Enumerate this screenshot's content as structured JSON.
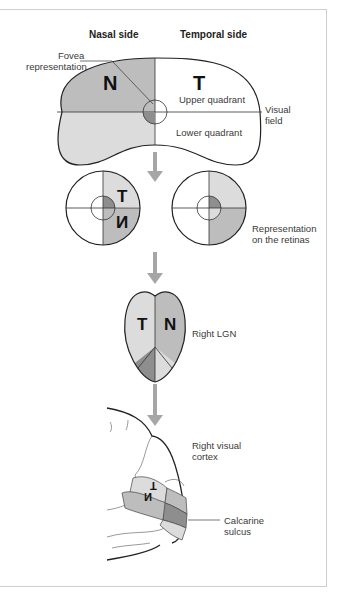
{
  "headers": {
    "nasal": "Nasal side",
    "temporal": "Temporal side"
  },
  "visual_field": {
    "fovea_label_line1": "Fovea",
    "fovea_label_line2": "representation",
    "letter_n": "N",
    "letter_t": "T",
    "upper": "Upper quadrant",
    "lower": "Lower quadrant",
    "label_line1": "Visual",
    "label_line2": "field"
  },
  "retinas": {
    "letter_t": "T",
    "letter_n": "N",
    "label_line1": "Representation",
    "label_line2": "on the retinas"
  },
  "lgn": {
    "letter_t": "T",
    "letter_n": "N",
    "label": "Right LGN"
  },
  "cortex": {
    "label_line1": "Right visual",
    "label_line2": "cortex",
    "letter_t": "T",
    "letter_n": "N",
    "sulcus_line1": "Calcarine",
    "sulcus_line2": "sulcus"
  },
  "colors": {
    "dark": "#8e8e8e",
    "mid": "#bdbdbd",
    "light": "#dcdcdc",
    "arrow": "#a6a6a6",
    "outline": "#222222"
  }
}
